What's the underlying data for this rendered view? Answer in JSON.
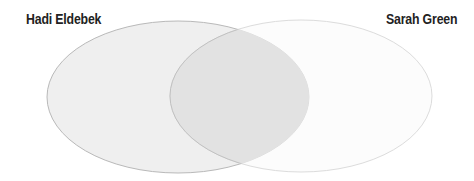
{
  "diagram": {
    "type": "venn",
    "sets": [
      {
        "label": "Hadi Eldebek",
        "fill": "#efefef",
        "stroke": "#b9b9b9"
      },
      {
        "label": "Sarah Green",
        "fill": "#fafafa",
        "stroke": "#dedede"
      }
    ],
    "overlap_fill": "#e2e2e2"
  }
}
